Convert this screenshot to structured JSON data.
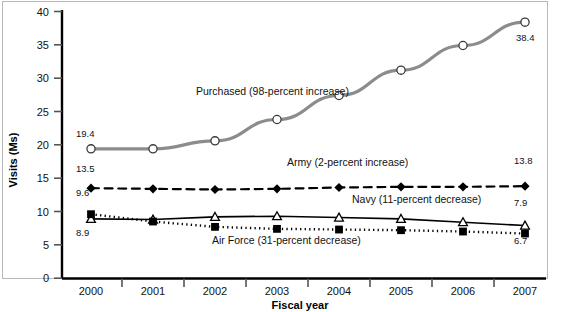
{
  "chart_data": {
    "type": "line",
    "title": "",
    "xlabel": "Fiscal year",
    "ylabel": "Visits (Ms)",
    "categories": [
      "2000",
      "2001",
      "2002",
      "2003",
      "2004",
      "2005",
      "2006",
      "2007"
    ],
    "ylim": [
      0,
      40
    ],
    "yticks": [
      0,
      5,
      10,
      15,
      20,
      25,
      30,
      35,
      40
    ],
    "ytick_labels": [
      "0",
      "5",
      "10",
      "15",
      "20",
      "25",
      "30",
      "35",
      "40"
    ],
    "grid": false,
    "legend": "inline-annotations",
    "series": [
      {
        "name": "Purchased",
        "annotation": "Purchased (98-percent increase)",
        "color": "#8c8c8c",
        "line_style": "solid",
        "line_width": 3.2,
        "marker": "circle-open",
        "values": [
          19.4,
          19.4,
          20.6,
          23.8,
          27.4,
          31.2,
          34.9,
          38.4
        ],
        "start_label": "19.4",
        "end_label": "38.4"
      },
      {
        "name": "Army",
        "annotation": "Army (2-percent increase)",
        "color": "#000000",
        "line_style": "dashed",
        "line_width": 2.2,
        "marker": "diamond-filled",
        "values": [
          13.5,
          13.4,
          13.3,
          13.4,
          13.6,
          13.7,
          13.7,
          13.8
        ],
        "start_label": "13.5",
        "end_label": "13.8"
      },
      {
        "name": "Navy",
        "annotation": "Navy (11-percent decrease)",
        "color": "#000000",
        "line_style": "solid",
        "line_width": 1.6,
        "marker": "triangle-open",
        "values": [
          8.9,
          8.8,
          9.2,
          9.3,
          9.1,
          8.9,
          8.4,
          7.9
        ],
        "start_label": "8.9",
        "end_label": "7.9"
      },
      {
        "name": "Air Force",
        "annotation": "Air Force (31-percent decrease)",
        "color": "#000000",
        "line_style": "dotted",
        "line_width": 2.4,
        "marker": "square-filled",
        "values": [
          9.6,
          8.5,
          7.7,
          7.4,
          7.3,
          7.2,
          7.0,
          6.7
        ],
        "start_label": "9.6",
        "end_label": "6.7"
      }
    ]
  },
  "axes": {
    "y_title": "Visits (Ms)",
    "x_title": "Fiscal year",
    "y_ticks": [
      "40",
      "35",
      "30",
      "25",
      "20",
      "15",
      "10",
      "5",
      "0"
    ],
    "x_ticks": [
      "2000",
      "2001",
      "2002",
      "2003",
      "2004",
      "2005",
      "2006",
      "2007"
    ]
  },
  "annotations": {
    "purchased": "Purchased (98-percent increase)",
    "army": "Army (2-percent increase)",
    "navy": "Navy (11-percent decrease)",
    "air_force": "Air Force (31-percent decrease)"
  },
  "value_labels": {
    "purchased_start": "19.4",
    "purchased_end": "38.4",
    "army_start": "13.5",
    "army_end": "13.8",
    "navy_start": "8.9",
    "navy_end": "7.9",
    "airforce_start": "9.6",
    "airforce_end": "6.7"
  },
  "colors": {
    "purchased_line": "#8c8c8c",
    "series_black": "#000000",
    "frame": "#b9b9b9",
    "axis": "#000000"
  }
}
